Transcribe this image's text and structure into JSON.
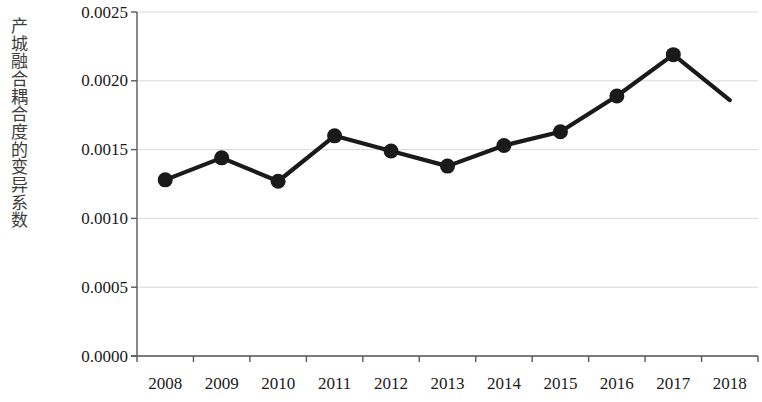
{
  "chart_data": {
    "type": "line",
    "title": "",
    "subtitle": "",
    "xlabel": "",
    "ylabel": "产城融合耦合度的变异系数",
    "categories": [
      "2008",
      "2009",
      "2010",
      "2011",
      "2012",
      "2013",
      "2014",
      "2015",
      "2016",
      "2017",
      "2018"
    ],
    "values": [
      0.00128,
      0.00144,
      0.00127,
      0.0016,
      0.00149,
      0.00138,
      0.00153,
      0.00163,
      0.00189,
      0.00219,
      0.00186
    ],
    "series": [
      {
        "name": "产城融合耦合度的变异系数",
        "values": [
          0.00128,
          0.00144,
          0.00127,
          0.0016,
          0.00149,
          0.00138,
          0.00153,
          0.00163,
          0.00189,
          0.00219,
          0.00186
        ]
      }
    ],
    "ylim": [
      0.0,
      0.0025
    ],
    "y_ticks": [
      0.0,
      0.0005,
      0.001,
      0.0015,
      0.002,
      0.0025
    ],
    "y_tick_labels": [
      "0.0000",
      "0.0005",
      "0.0010",
      "0.0015",
      "0.0020",
      "0.0025"
    ],
    "grid": true,
    "grid_axis": "y",
    "legend": false,
    "legend_position": "none",
    "marker": "circle",
    "line_color": "#1a1a1a",
    "marker_color": "#1a1a1a",
    "grid_color": "#d9d9d9",
    "axis_color": "#595959",
    "background": "#ffffff"
  },
  "axis": {
    "y_title": "产城融合耦合度的变异系数"
  }
}
